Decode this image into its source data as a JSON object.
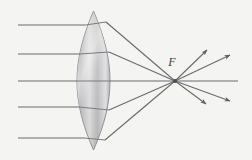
{
  "figure": {
    "background_color": "#f4f4f2",
    "ray_color": "#6a6a70",
    "lens_outline_color": "#8e8e92",
    "label_color": "#3a3a3e",
    "width": 252,
    "height": 160
  },
  "labels": {
    "focal_point": "F"
  },
  "optical_axis": {
    "y": 81,
    "x_start": 18,
    "x_end": 238
  },
  "lens": {
    "type": "biconvex",
    "center_x": 93.5,
    "top_y": 11,
    "bottom_y": 150,
    "left_edge_x": 77,
    "right_edge_x": 110,
    "half_width": 16.5
  },
  "focal_point": {
    "x": 175,
    "y": 81,
    "label_x": 172,
    "label_y": 66
  },
  "incoming_rays": [
    {
      "y": 25,
      "x_start": 18,
      "x_end": 85.5
    },
    {
      "y": 54,
      "x_start": 18,
      "x_end": 79.5
    },
    {
      "y": 81,
      "x_start": 18,
      "x_end": 77
    },
    {
      "y": 107,
      "x_start": 18,
      "x_end": 79
    },
    {
      "y": 138,
      "x_start": 18,
      "x_end": 84
    }
  ],
  "refracted_rays": [
    {
      "x1": 106,
      "y1": 22,
      "x2": 175,
      "y2": 81
    },
    {
      "x1": 109,
      "y1": 52,
      "x2": 175,
      "y2": 81
    },
    {
      "x1": 110,
      "y1": 81,
      "x2": 175,
      "y2": 81
    },
    {
      "x1": 109,
      "y1": 110,
      "x2": 175,
      "y2": 81
    },
    {
      "x1": 105,
      "y1": 140,
      "x2": 175,
      "y2": 81
    }
  ],
  "diverging_rays": [
    {
      "x1": 175,
      "y1": 81,
      "x2": 207,
      "y2": 50
    },
    {
      "x1": 175,
      "y1": 81,
      "x2": 230,
      "y2": 55
    },
    {
      "x1": 175,
      "y1": 81,
      "x2": 230,
      "y2": 101
    },
    {
      "x1": 175,
      "y1": 81,
      "x2": 206,
      "y2": 104
    }
  ]
}
